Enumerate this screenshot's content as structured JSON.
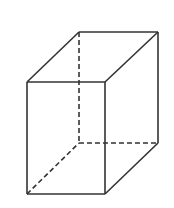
{
  "diagram": {
    "title": "",
    "shape": "rectangular-prism",
    "stroke_color": "#333333",
    "background": "#ffffff",
    "stroke_width": 1.6,
    "dash_pattern": "5 3",
    "vertices": {
      "front_top_left": [
        27,
        82
      ],
      "front_top_right": [
        105,
        82
      ],
      "front_bottom_left": [
        27,
        194
      ],
      "front_bottom_right": [
        105,
        194
      ],
      "back_top_left": [
        79,
        32
      ],
      "back_top_right": [
        158,
        32
      ],
      "back_bottom_left": [
        79,
        143
      ],
      "back_bottom_right": [
        158,
        143
      ]
    },
    "solid_edges": [
      [
        "front_top_left",
        "front_top_right"
      ],
      [
        "front_top_right",
        "front_bottom_right"
      ],
      [
        "front_bottom_right",
        "front_bottom_left"
      ],
      [
        "front_bottom_left",
        "front_top_left"
      ],
      [
        "back_top_left",
        "back_top_right"
      ],
      [
        "back_top_right",
        "back_bottom_right"
      ],
      [
        "front_top_left",
        "back_top_left"
      ],
      [
        "front_top_right",
        "back_top_right"
      ],
      [
        "front_bottom_right",
        "back_bottom_right"
      ]
    ],
    "hidden_edges": [
      [
        "back_top_left",
        "back_bottom_left"
      ],
      [
        "back_bottom_left",
        "back_bottom_right"
      ],
      [
        "front_bottom_left",
        "back_bottom_left"
      ]
    ]
  }
}
